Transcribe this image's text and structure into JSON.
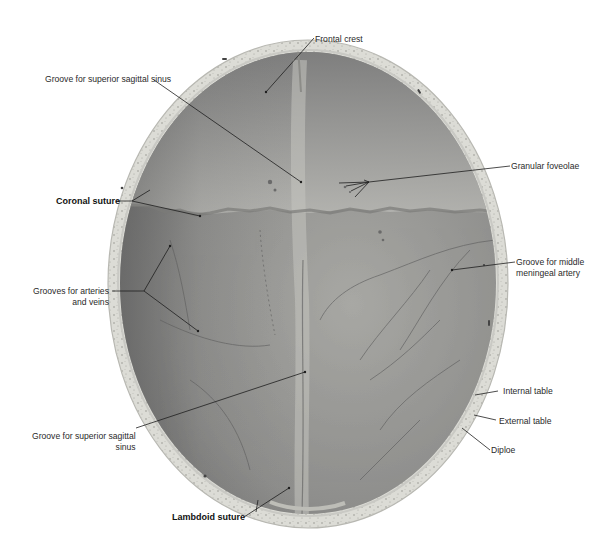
{
  "figure": {
    "colors": {
      "background": "#ffffff",
      "bone_rim": "#dcdcd6",
      "diploe_speckle": "#9a9a94",
      "interior_dark": "#6e6e6e",
      "interior_mid": "#8c8c8c",
      "interior_light": "#b4b4b0",
      "leader_line": "#1e1e1e",
      "label_text": "#2a2a2a"
    }
  },
  "labels": {
    "frontal_crest": "Frontal crest",
    "groove_sss_top": "Groove for superior sagittal sinus",
    "granular_foveolae": "Granular foveolae",
    "coronal_suture": "Coronal suture",
    "groove_mma_line1": "Groove for middle",
    "groove_mma_line2": "meningeal artery",
    "grooves_av_line1": "Grooves for arteries",
    "grooves_av_line2": "and veins",
    "internal_table": "Internal table",
    "external_table": "External table",
    "groove_sss_bottom_line1": "Groove for superior sagittal",
    "groove_sss_bottom_line2": "sinus",
    "diploe": "Diploe",
    "lambdoid_suture": "Lambdoid suture"
  }
}
